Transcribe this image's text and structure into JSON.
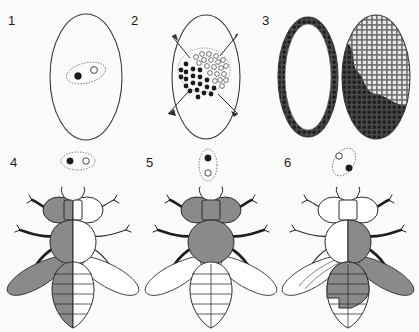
{
  "figure": {
    "background_color": "#fbfbfa",
    "line_color": "#2b2b2b",
    "shaded_color": "#8a8a8a",
    "unshaded_color": "#ffffff"
  },
  "panels": [
    {
      "label": "1",
      "name": "panel-egg-two-nuclei",
      "description": "Egg outline containing a single cell with two nuclei, one darkly shaded and one unshaded",
      "egg": {
        "shape": "ellipse",
        "filled": false
      },
      "cell": {
        "orientation": "tilted",
        "nuclei": [
          {
            "id": "nucleus-dark",
            "shading": "dark",
            "position": "left"
          },
          {
            "id": "nucleus-open",
            "shading": "open",
            "position": "right"
          }
        ]
      }
    },
    {
      "label": "2",
      "name": "panel-cleavage-nuclei-migrating",
      "description": "Cluster of cleavage nuclei at centre of egg with four arrows showing migration to the periphery",
      "egg": {
        "shape": "ellipse",
        "filled": false
      },
      "cluster": {
        "dark_region": "lower-left",
        "open_region": "upper-right"
      },
      "arrows": [
        {
          "direction": "upper-left"
        },
        {
          "direction": "upper-right"
        },
        {
          "direction": "lower-left"
        },
        {
          "direction": "lower-right"
        }
      ]
    },
    {
      "label": "3",
      "name": "panel-blastoderm",
      "description": "Two eggs: left shows nuclei arranged as a ring at the periphery, right shows the cellular blastoderm surface as a mosaic of dark and light territories",
      "eggs": [
        {
          "id": "egg-ring-blastoderm",
          "pattern": "peripheral-ring"
        },
        {
          "id": "egg-surface-mosaic",
          "pattern": "dark-light-mosaic",
          "boundary": "irregular jagged"
        }
      ]
    },
    {
      "label": "4",
      "name": "panel-fly-bilateral-gynandromorph",
      "description": "Adult fly with the entire left half shaded and the right half unshaded",
      "cell": {
        "orientation": "horizontal",
        "nuclei": [
          {
            "id": "nucleus-dark",
            "shading": "dark",
            "position": "left"
          },
          {
            "id": "nucleus-open",
            "shading": "open",
            "position": "right"
          }
        ]
      },
      "fly": {
        "pattern": "bilateral",
        "shaded_parts": [
          "left eye",
          "left thorax",
          "left abdomen",
          "left wing",
          "left legs"
        ],
        "unshaded_parts": [
          "right eye",
          "right thorax",
          "right abdomen",
          "right wing",
          "right legs"
        ]
      }
    },
    {
      "label": "5",
      "name": "panel-fly-anterior-posterior-mosaic",
      "description": "Adult fly with head and thorax shaded and abdomen unshaded",
      "cell": {
        "orientation": "vertical",
        "nuclei": [
          {
            "id": "nucleus-dark",
            "shading": "dark",
            "position": "top"
          },
          {
            "id": "nucleus-open",
            "shading": "open",
            "position": "bottom"
          }
        ]
      },
      "fly": {
        "pattern": "anterior-posterior",
        "shaded_parts": [
          "head",
          "thorax",
          "all legs"
        ],
        "unshaded_parts": [
          "abdomen",
          "both wings"
        ]
      }
    },
    {
      "label": "6",
      "name": "panel-fly-irregular-mosaic",
      "description": "Adult fly with an irregular mosaic: right thorax, right wing and most of the abdomen shaded, head unshaded",
      "cell": {
        "orientation": "tilted-reverse",
        "nuclei": [
          {
            "id": "nucleus-open",
            "shading": "open",
            "position": "upper-left"
          },
          {
            "id": "nucleus-dark",
            "shading": "dark",
            "position": "lower-right"
          }
        ]
      },
      "fly": {
        "pattern": "irregular-mosaic",
        "shaded_parts": [
          "right thorax",
          "right wing",
          "right legs",
          "upper abdomen"
        ],
        "unshaded_parts": [
          "head",
          "left thorax",
          "left wing",
          "lower left abdomen"
        ]
      }
    }
  ]
}
